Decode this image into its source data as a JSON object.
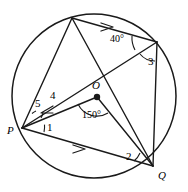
{
  "figure": {
    "type": "circle-geometry-diagram",
    "stroke_color": "#1a1a1a",
    "background_color": "#ffffff",
    "circle": {
      "cx": 94,
      "cy": 96,
      "r": 82
    },
    "points": {
      "P": {
        "label": "P",
        "x": 22,
        "y": 128
      },
      "Q": {
        "label": "Q",
        "x": 153,
        "y": 166
      },
      "O": {
        "label": "O",
        "x": 97,
        "y": 97
      },
      "T": {
        "x": 72,
        "y": 18
      },
      "R": {
        "x": 157,
        "y": 42
      }
    },
    "point_labels": [
      {
        "name": "label-P",
        "text": "P",
        "x": 7,
        "y": 125
      },
      {
        "name": "label-Q",
        "text": "Q",
        "x": 158,
        "y": 170
      },
      {
        "name": "label-O",
        "text": "O",
        "x": 92,
        "y": 80
      }
    ],
    "angle_labels": [
      {
        "name": "angle-label-1",
        "text": "1",
        "x": 47,
        "y": 122
      },
      {
        "name": "angle-label-2",
        "text": "2",
        "x": 126,
        "y": 151
      },
      {
        "name": "angle-label-3",
        "text": "3",
        "x": 148,
        "y": 56
      },
      {
        "name": "angle-label-4",
        "text": "4",
        "x": 50,
        "y": 90
      },
      {
        "name": "angle-label-5",
        "text": "5",
        "x": 35,
        "y": 98
      }
    ],
    "measure_labels": [
      {
        "name": "angle-measure-40",
        "text": "40°",
        "x": 110,
        "y": 34
      },
      {
        "name": "angle-measure-150",
        "text": "150°",
        "x": 82,
        "y": 110
      }
    ],
    "parallel_marks": [
      {
        "name": "arrow-mark-top-chord",
        "x": 108,
        "y": 26,
        "angle": 17
      },
      {
        "name": "arrow-mark-bottom-chord",
        "x": 80,
        "y": 149,
        "angle": 17
      },
      {
        "name": "arrow-mark-inner-chord",
        "x": 47,
        "y": 110,
        "angle": -24
      }
    ],
    "segments": [
      {
        "name": "chord-P-T",
        "from": "P",
        "to": "T"
      },
      {
        "name": "chord-T-R",
        "from": "T",
        "to": "R"
      },
      {
        "name": "chord-T-Q",
        "from": "T",
        "to": "Q"
      },
      {
        "name": "chord-P-R",
        "from": "P",
        "to": "R"
      },
      {
        "name": "chord-R-Q",
        "from": "R",
        "to": "Q"
      },
      {
        "name": "chord-P-Q",
        "from": "P",
        "to": "Q"
      },
      {
        "name": "segment-P-O",
        "from": "P",
        "to": "O"
      },
      {
        "name": "segment-O-Q",
        "from": "O",
        "to": "Q"
      }
    ]
  }
}
